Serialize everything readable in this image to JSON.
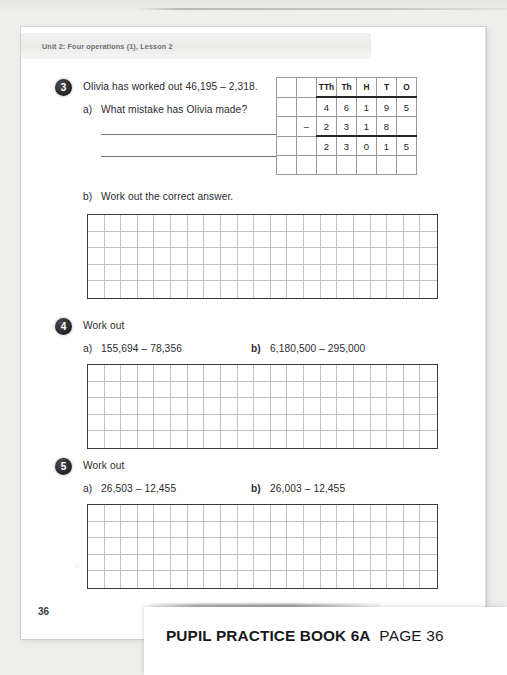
{
  "document": {
    "running_head": "Unit 2: Four operations (1), Lesson 2",
    "folio": "36"
  },
  "caption": {
    "book_title": "PUPIL PRACTICE BOOK 6A",
    "page_label": "PAGE 36"
  },
  "questions": [
    {
      "number": "3",
      "stem": "Olivia has worked out 46,195 – 2,318.",
      "parts": [
        {
          "label": "a)",
          "text": "What mistake has Olivia made?"
        },
        {
          "label": "b)",
          "text": "Work out the correct answer."
        }
      ]
    },
    {
      "number": "4",
      "stem": "Work out",
      "parts": [
        {
          "label": "a)",
          "text": "155,694 – 78,356"
        },
        {
          "label": "b)",
          "text": "6,180,500 – 295,000"
        }
      ]
    },
    {
      "number": "5",
      "stem": "Work out",
      "parts": [
        {
          "label": "a)",
          "text": "26,503 – 12,455"
        },
        {
          "label": "b)",
          "text": "26,003 – 12,455"
        }
      ]
    }
  ],
  "place_value_table": {
    "columns": 7,
    "rows": 5,
    "headers": [
      "",
      "",
      "TTh",
      "Th",
      "H",
      "T",
      "O"
    ],
    "minuend": [
      "",
      "",
      "4",
      "6",
      "1",
      "9",
      "5"
    ],
    "subtrahend": [
      "",
      "–",
      "2",
      "3",
      "1",
      "8",
      ""
    ],
    "result": [
      "",
      "",
      "2",
      "3",
      "0",
      "1",
      "5"
    ],
    "blank_row": [
      "",
      "",
      "",
      "",
      "",
      "",
      ""
    ]
  },
  "work_grids": {
    "columns": 21,
    "rows": 5,
    "count": 3
  },
  "colors": {
    "page_background": "#ffffff",
    "scan_background": "#eeeeec",
    "ink": "#2b2b30",
    "grid_line": "#c2c2c2",
    "grid_border": "#3a3a3e",
    "question_bullet": "#232327"
  }
}
